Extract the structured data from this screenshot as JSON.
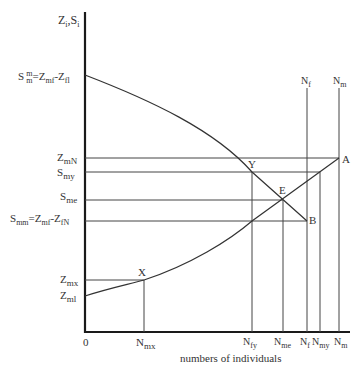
{
  "diagram": {
    "y_axis_label": {
      "main": "Z",
      "sub1": "i",
      "sep": ",",
      "main2": "S",
      "sub2": "i"
    },
    "x_axis_label": "numbers of individuals",
    "origin_label": "0",
    "y_labels": {
      "smm_top": {
        "text": "S",
        "sup": "m",
        "sub": "m",
        "rest": "=Z",
        "rest_sub": "mf",
        "rest2": "-Z",
        "rest2_sub": "fl"
      },
      "zmN": {
        "main": "Z",
        "sub": "mN"
      },
      "smy": {
        "main": "S",
        "sub": "my"
      },
      "sme": {
        "main": "S",
        "sub": "me"
      },
      "smm": {
        "main": "S",
        "sub": "mm",
        "rest": "=Z",
        "rest_sub": "mf",
        "rest2": "-Z",
        "rest2_sub": "fN"
      },
      "zmx": {
        "main": "Z",
        "sub": "mx"
      },
      "zml": {
        "main": "Z",
        "sub": "ml"
      }
    },
    "x_labels": {
      "nmx": {
        "main": "N",
        "sub": "mx"
      },
      "nfy": {
        "main": "N",
        "sub": "fy"
      },
      "nme": {
        "main": "N",
        "sub": "me"
      },
      "nf": {
        "main": "N",
        "sub": "f"
      },
      "nmy": {
        "main": "N",
        "sub": "my"
      },
      "nm": {
        "main": "N",
        "sub": "m"
      }
    },
    "top_labels": {
      "nf": {
        "main": "N",
        "sub": "f"
      },
      "nm": {
        "main": "N",
        "sub": "m"
      }
    },
    "points": {
      "A": "A",
      "B": "B",
      "E": "E",
      "X": "X",
      "Y": "Y"
    }
  }
}
